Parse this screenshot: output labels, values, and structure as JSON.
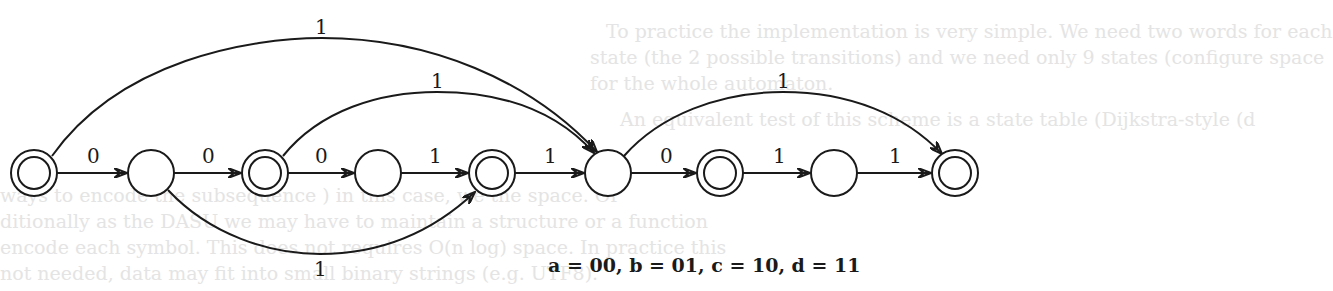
{
  "background_text": [
    "To practice the implementation is very simple. We need two words for each",
    "state (the 2 possible transitions) and we need only 9 states (configure space",
    "for the whole automaton.",
    "An equivalent test of this scheme is a state table (Dijkstra-style (d",
    "ways to encode the subsequence ) in this case, we the space. Or",
    "ditionally as the DASU we may have to maintain a structure or a function",
    "encode each symbol. This does not requires O(n log) space. In practice this",
    "not needed, data may fit into small binary strings (e.g. UTF8)."
  ],
  "diagram": {
    "nodes": [
      {
        "id": "q0",
        "x": 34,
        "y": 173,
        "accepting": true
      },
      {
        "id": "q1",
        "x": 151,
        "y": 173,
        "accepting": false
      },
      {
        "id": "q2",
        "x": 265,
        "y": 173,
        "accepting": true
      },
      {
        "id": "q3",
        "x": 378,
        "y": 173,
        "accepting": false
      },
      {
        "id": "q4",
        "x": 492,
        "y": 173,
        "accepting": true
      },
      {
        "id": "q5",
        "x": 608,
        "y": 173,
        "accepting": false
      },
      {
        "id": "q6",
        "x": 720,
        "y": 173,
        "accepting": true
      },
      {
        "id": "q7",
        "x": 834,
        "y": 173,
        "accepting": false
      },
      {
        "id": "q8",
        "x": 955,
        "y": 173,
        "accepting": true
      }
    ],
    "edges": [
      {
        "from": "q0",
        "to": "q1",
        "label": "0"
      },
      {
        "from": "q1",
        "to": "q2",
        "label": "0"
      },
      {
        "from": "q2",
        "to": "q3",
        "label": "0"
      },
      {
        "from": "q3",
        "to": "q4",
        "label": "1"
      },
      {
        "from": "q4",
        "to": "q5",
        "label": "1"
      },
      {
        "from": "q5",
        "to": "q6",
        "label": "0"
      },
      {
        "from": "q6",
        "to": "q7",
        "label": "1"
      },
      {
        "from": "q7",
        "to": "q8",
        "label": "1"
      },
      {
        "from": "q0",
        "to": "q5",
        "label": "1",
        "curve": "top-outer"
      },
      {
        "from": "q2",
        "to": "q5",
        "label": "1",
        "curve": "top-inner"
      },
      {
        "from": "q5",
        "to": "q8",
        "label": "1",
        "curve": "top-right"
      },
      {
        "from": "q1",
        "to": "q4",
        "label": "1",
        "curve": "bottom"
      }
    ]
  },
  "labels": {
    "e01": "0",
    "e12": "0",
    "e23": "0",
    "e34": "1",
    "e45": "1",
    "e56": "0",
    "e67": "1",
    "e78": "1",
    "arc_outer": "1",
    "arc_inner": "1",
    "arc_right": "1",
    "arc_bottom": "1"
  },
  "legend": "a = 00, b = 01, c = 10, d = 11",
  "colors": {
    "ink": "#1a1a1a",
    "background": "#ffffff",
    "faded_text": "#e4e4e4"
  }
}
